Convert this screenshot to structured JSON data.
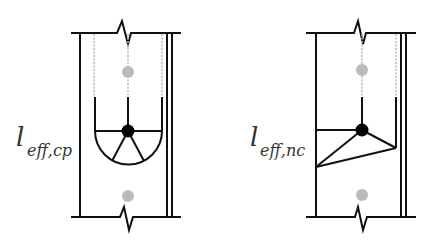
{
  "panels": [
    {
      "id": "cp",
      "label_main": "l",
      "label_sub": "eff,cp",
      "description": "Circular pattern effective length"
    },
    {
      "id": "nc",
      "label_main": "l",
      "label_sub": "eff,nc",
      "description": "Non-circular pattern effective length"
    }
  ],
  "colors": {
    "line": "#111111",
    "bolt_active": "#000000",
    "bolt_inactive": "#bbbbbb",
    "dashed": "#bbbbbb"
  }
}
